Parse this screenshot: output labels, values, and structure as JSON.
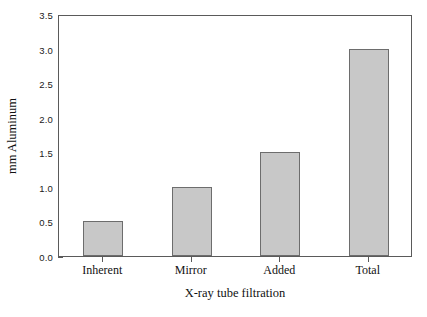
{
  "chart_data": {
    "type": "bar",
    "title": "",
    "categories": [
      "Inherent",
      "Mirror",
      "Added",
      "Total"
    ],
    "values": [
      0.5,
      1.0,
      1.5,
      3.0
    ],
    "xlabel": "X-ray tube filtration",
    "ylabel": "mm Aluminum",
    "ylim": [
      0.0,
      3.5
    ],
    "ytick_labels": [
      "0.0",
      "0.5",
      "1.0",
      "1.5",
      "2.0",
      "2.5",
      "3.0",
      "3.5"
    ],
    "ytick_values": [
      0.0,
      0.5,
      1.0,
      1.5,
      2.0,
      2.5,
      3.0,
      3.5
    ],
    "grid": false,
    "legend": null,
    "bar_color": "#c8c8c8",
    "bar_edge_color": "#6d6d6d",
    "axis_color": "#5a5a5a",
    "background": "#ffffff"
  }
}
